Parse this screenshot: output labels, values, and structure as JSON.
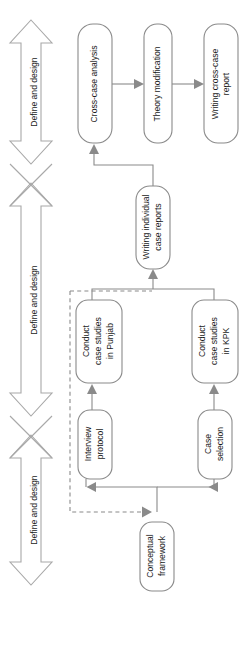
{
  "figure": {
    "orientation": "rotated-90",
    "colors": {
      "background": "#ffffff",
      "box_stroke": "#8a8a8a",
      "arrow_stroke": "#a8a8a8",
      "text": "#1a1a1a"
    }
  },
  "phase_arrows": [
    {
      "id": "phase-1",
      "label": "Define and design"
    },
    {
      "id": "phase-2",
      "label": "Define and design"
    },
    {
      "id": "phase-3",
      "label": "Define and design"
    }
  ],
  "nodes": [
    {
      "id": "cross-case-analysis",
      "lines": [
        "Cross-case analysis"
      ]
    },
    {
      "id": "theory-modification",
      "lines": [
        "Theory modification"
      ]
    },
    {
      "id": "writing-cross-case-report",
      "lines": [
        "Writing cross-case",
        "report"
      ]
    },
    {
      "id": "writing-individual-case-reports",
      "lines": [
        "Writing individual",
        "case reports"
      ]
    },
    {
      "id": "conduct-case-studies-punjab",
      "lines": [
        "Conduct",
        "case studies",
        "in Punjab"
      ]
    },
    {
      "id": "conduct-case-studies-kpk",
      "lines": [
        "Conduct",
        "case studies",
        "in KPK"
      ]
    },
    {
      "id": "interview-protocol",
      "lines": [
        "Interview",
        "protocol"
      ]
    },
    {
      "id": "case-selection",
      "lines": [
        "Case",
        "selection"
      ]
    },
    {
      "id": "conceptual-framework",
      "lines": [
        "Conceptual",
        "framework"
      ]
    }
  ],
  "connections": [
    {
      "from": "cross-case-analysis",
      "to": "theory-modification",
      "style": "solid"
    },
    {
      "from": "theory-modification",
      "to": "writing-cross-case-report",
      "style": "solid"
    },
    {
      "from": "writing-individual-case-reports",
      "to": "cross-case-analysis",
      "style": "solid"
    },
    {
      "from": "conduct-case-studies-punjab",
      "to": "writing-individual-case-reports",
      "style": "solid"
    },
    {
      "from": "conduct-case-studies-kpk",
      "to": "writing-individual-case-reports",
      "style": "solid"
    },
    {
      "from": "interview-protocol",
      "to": "conduct-case-studies-punjab",
      "style": "solid"
    },
    {
      "from": "case-selection",
      "to": "conduct-case-studies-kpk",
      "style": "solid"
    },
    {
      "from": "conceptual-framework",
      "to": "interview-protocol",
      "style": "solid"
    },
    {
      "from": "conceptual-framework",
      "to": "case-selection",
      "style": "solid"
    },
    {
      "from": "conceptual-framework",
      "to": "writing-individual-case-reports",
      "style": "dashed"
    }
  ]
}
